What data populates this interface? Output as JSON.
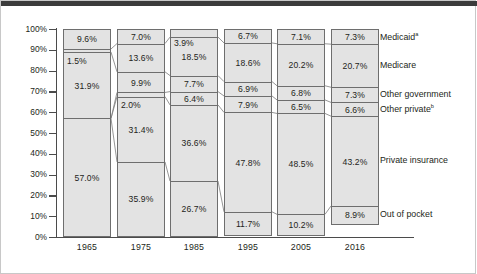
{
  "chart_data": {
    "type": "bar",
    "title": "",
    "subtitle": "",
    "xlabel": "",
    "ylabel": "",
    "ylim": [
      0,
      100
    ],
    "grid": false,
    "stacked": true,
    "stack_order_top_to_bottom": [
      "Medicaid",
      "Medicare",
      "Other government",
      "Other private",
      "Private insurance",
      "Out of pocket"
    ],
    "legend_position": "right",
    "categories": [
      "1965",
      "1975",
      "1985",
      "1995",
      "2005",
      "2016"
    ],
    "ytick_labels": [
      "100%",
      "90%",
      "80%",
      "70%",
      "60%",
      "50%",
      "40%",
      "30%",
      "20%",
      "10%",
      "0%"
    ],
    "ytick_values": [
      100,
      90,
      80,
      70,
      60,
      50,
      40,
      30,
      20,
      10,
      0
    ],
    "series": [
      {
        "name": "Medicaid",
        "label": "Medicaid",
        "footnote": "a",
        "values": [
          9.6,
          7.0,
          3.9,
          6.7,
          7.1,
          7.3
        ],
        "value_labels": [
          "9.6%",
          "7.0%",
          "3.9%",
          "6.7%",
          "7.1%",
          "7.3%"
        ]
      },
      {
        "name": "Medicare",
        "label": "Medicare",
        "footnote": "",
        "values": [
          1.5,
          13.6,
          18.5,
          18.6,
          20.2,
          20.7
        ],
        "value_labels": [
          "1.5%",
          "13.6%",
          "18.5%",
          "18.6%",
          "20.2%",
          "20.7%"
        ]
      },
      {
        "name": "Other government",
        "label": "Other government",
        "footnote": "",
        "values": [
          31.9,
          9.9,
          7.7,
          6.9,
          6.8,
          7.3
        ],
        "value_labels": [
          "31.9%",
          "9.9%",
          "7.7%",
          "6.9%",
          "6.8%",
          "7.3%"
        ]
      },
      {
        "name": "Other private",
        "label": "Other private",
        "footnote": "b",
        "values": [
          0.0,
          2.0,
          6.4,
          7.9,
          6.5,
          6.6
        ],
        "value_labels": [
          "",
          "2.0%",
          "6.4%",
          "7.9%",
          "6.5%",
          "6.6%"
        ]
      },
      {
        "name": "Private insurance",
        "label": "Private insurance",
        "footnote": "",
        "values": [
          0.0,
          31.4,
          36.6,
          47.8,
          48.5,
          43.2
        ],
        "value_labels": [
          "",
          "31.4%",
          "36.6%",
          "47.8%",
          "48.5%",
          "43.2%"
        ]
      },
      {
        "name": "Out of pocket",
        "label": "Out of pocket",
        "footnote": "",
        "values": [
          57.0,
          35.9,
          26.7,
          11.7,
          10.2,
          8.9
        ],
        "value_labels": [
          "57.0%",
          "35.9%",
          "26.7%",
          "11.7%",
          "10.2%",
          "8.9%"
        ]
      }
    ]
  },
  "axis": {
    "y_ticks": [
      {
        "label": "100%"
      },
      {
        "label": "90%"
      },
      {
        "label": "80%"
      },
      {
        "label": "70%"
      },
      {
        "label": "60%"
      },
      {
        "label": "50%"
      },
      {
        "label": "40%"
      },
      {
        "label": "30%"
      },
      {
        "label": "20%"
      },
      {
        "label": "10%"
      },
      {
        "label": "0%"
      }
    ],
    "x_labels": [
      "1965",
      "1975",
      "1985",
      "1995",
      "2005",
      "2016"
    ]
  },
  "legend": {
    "items": [
      {
        "label": "Medicaid",
        "footnote": "a"
      },
      {
        "label": "Medicare",
        "footnote": ""
      },
      {
        "label": "Other government",
        "footnote": ""
      },
      {
        "label": "Other private",
        "footnote": "b"
      },
      {
        "label": "Private insurance",
        "footnote": ""
      },
      {
        "label": "Out of pocket",
        "footnote": ""
      }
    ]
  },
  "bars": {
    "b1965": {
      "year": "1965",
      "segments": [
        {
          "name": "medicaid",
          "label": "9.6%"
        },
        {
          "name": "medicare",
          "label": "1.5%"
        },
        {
          "name": "other-government",
          "label": "31.9%"
        },
        {
          "name": "other-private",
          "label": ""
        },
        {
          "name": "private-insurance",
          "label": ""
        },
        {
          "name": "out-of-pocket",
          "label": "57.0%"
        }
      ]
    },
    "b1975": {
      "year": "1975",
      "segments": [
        {
          "name": "medicaid",
          "label": "7.0%"
        },
        {
          "name": "medicare",
          "label": "13.6%"
        },
        {
          "name": "other-government",
          "label": "9.9%"
        },
        {
          "name": "other-private",
          "label": "2.0%"
        },
        {
          "name": "private-insurance",
          "label": "31.4%"
        },
        {
          "name": "out-of-pocket",
          "label": "35.9%"
        }
      ]
    },
    "b1985": {
      "year": "1985",
      "segments": [
        {
          "name": "medicaid",
          "label": "3.9%"
        },
        {
          "name": "medicare",
          "label": "18.5%"
        },
        {
          "name": "other-government",
          "label": "7.7%"
        },
        {
          "name": "other-private",
          "label": "6.4%"
        },
        {
          "name": "private-insurance",
          "label": "36.6%"
        },
        {
          "name": "out-of-pocket",
          "label": "26.7%"
        }
      ]
    },
    "b1995": {
      "year": "1995",
      "segments": [
        {
          "name": "medicaid",
          "label": "6.7%"
        },
        {
          "name": "medicare",
          "label": "18.6%"
        },
        {
          "name": "other-government",
          "label": "6.9%"
        },
        {
          "name": "other-private",
          "label": "7.9%"
        },
        {
          "name": "private-insurance",
          "label": "47.8%"
        },
        {
          "name": "out-of-pocket",
          "label": "11.7%"
        }
      ]
    },
    "b2005": {
      "year": "2005",
      "segments": [
        {
          "name": "medicaid",
          "label": "7.1%"
        },
        {
          "name": "medicare",
          "label": "20.2%"
        },
        {
          "name": "other-government",
          "label": "6.8%"
        },
        {
          "name": "other-private",
          "label": "6.5%"
        },
        {
          "name": "private-insurance",
          "label": "48.5%"
        },
        {
          "name": "out-of-pocket",
          "label": "10.2%"
        }
      ]
    },
    "b2016": {
      "year": "2016",
      "segments": [
        {
          "name": "medicaid",
          "label": "7.3%"
        },
        {
          "name": "medicare",
          "label": "20.7%"
        },
        {
          "name": "other-government",
          "label": "7.3%"
        },
        {
          "name": "other-private",
          "label": "6.6%"
        },
        {
          "name": "private-insurance",
          "label": "43.2%"
        },
        {
          "name": "out-of-pocket",
          "label": "8.9%"
        }
      ]
    }
  },
  "colors": {
    "segment_fill": "#e3e3e3",
    "segment_stroke": "#6e6e6e",
    "axis": "#4b4b4b",
    "text": "#231f20",
    "topbar": "#3b3b3b"
  }
}
